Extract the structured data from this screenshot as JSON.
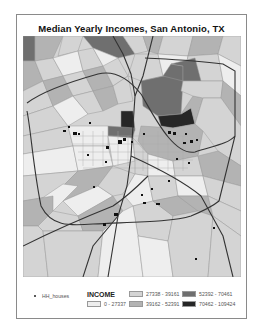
{
  "title": "Median Yearly Incomes, San Antonio, TX",
  "legend": {
    "points_label": "HH_houses",
    "field_label": "INCOME",
    "classes": [
      {
        "range": "0 - 27337",
        "color": "#eeeeee"
      },
      {
        "range": "27338 - 39161",
        "color": "#d4d4d4"
      },
      {
        "range": "39162 - 52391",
        "color": "#b3b3b3"
      },
      {
        "range": "52392 - 70461",
        "color": "#6f6f6f"
      },
      {
        "range": "70462 - 109424",
        "color": "#262626"
      }
    ]
  },
  "colors": {
    "class1": "#eeeeee",
    "class2": "#d4d4d4",
    "class3": "#b3b3b3",
    "class4": "#6f6f6f",
    "class5": "#262626",
    "boundary": "#9a9a9a",
    "highway": "#333333",
    "points": "#111111"
  }
}
